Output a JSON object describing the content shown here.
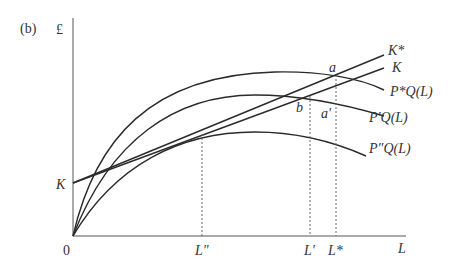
{
  "panel_label": "(b)",
  "axes": {
    "y_label": "£",
    "x_label": "L",
    "origin_label": "0",
    "y_intercept_label": "K"
  },
  "lines": {
    "k_star": "K*",
    "k": "K"
  },
  "curves": {
    "p_star": "P*Q(L)",
    "p_prime": "P'Q(L)",
    "p_double_prime": "P\"Q(L)"
  },
  "points": {
    "a": "a",
    "a_prime": "a'",
    "b": "b"
  },
  "x_ticks": {
    "l_double_prime": "L\"",
    "l_prime": "L'",
    "l_star": "L*"
  }
}
